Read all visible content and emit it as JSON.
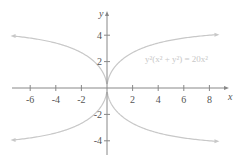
{
  "chart_data": {
    "type": "line",
    "title": "",
    "equation": "y²(x² + y²) = 20x²",
    "xlabel": "x",
    "ylabel": "y",
    "xlim": [
      -7.5,
      9.5
    ],
    "ylim": [
      -5,
      5
    ],
    "x_ticks": [
      -6,
      -4,
      -2,
      2,
      4,
      6,
      8
    ],
    "x_tick_labels": [
      "-6",
      "-4",
      "-2",
      "2",
      "4",
      "6",
      "8"
    ],
    "y_ticks": [
      4,
      2,
      -2,
      -4
    ],
    "y_tick_labels": [
      "4",
      "2",
      "-2",
      "-4"
    ],
    "grid": false,
    "legend": null,
    "asymptotes": [
      4.472,
      -4.472
    ],
    "series": [
      {
        "name": "upper-right branch",
        "x": [
          0,
          0.5,
          1,
          2,
          3,
          4,
          6,
          8.5
        ],
        "y": [
          0,
          1.92,
          2.47,
          3.25,
          3.68,
          3.93,
          4.21,
          4.33
        ]
      },
      {
        "name": "upper-left branch",
        "x": [
          0,
          -0.5,
          -1,
          -2,
          -3,
          -4,
          -6,
          -7.3
        ],
        "y": [
          0,
          1.92,
          2.47,
          3.25,
          3.68,
          3.93,
          4.21,
          4.28
        ]
      },
      {
        "name": "lower-right branch",
        "x": [
          0,
          0.5,
          1,
          2,
          3,
          4,
          6,
          8.5
        ],
        "y": [
          0,
          -1.92,
          -2.47,
          -3.25,
          -3.68,
          -3.93,
          -4.21,
          -4.33
        ]
      },
      {
        "name": "lower-left branch",
        "x": [
          0,
          -0.5,
          -1,
          -2,
          -3,
          -4,
          -6,
          -7.3
        ],
        "y": [
          0,
          -1.92,
          -2.47,
          -3.25,
          -3.68,
          -3.93,
          -4.21,
          -4.28
        ]
      }
    ],
    "colors": {
      "curve": "#c8c8c8",
      "axis": "#888888",
      "text": "#555555"
    }
  }
}
